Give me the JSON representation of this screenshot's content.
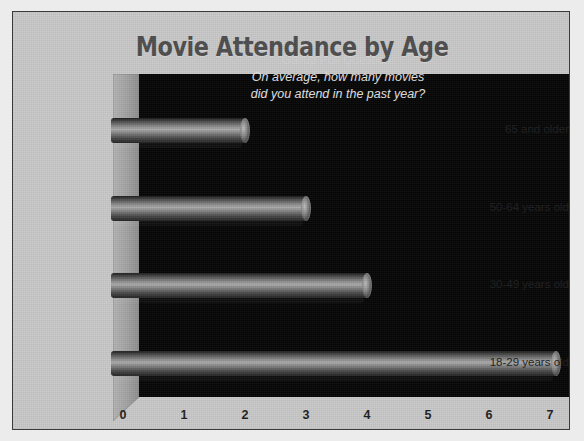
{
  "chart_data": {
    "type": "bar",
    "orientation": "horizontal",
    "title": "Movie Attendance by Age",
    "categories": [
      "65 and older",
      "50-64 years old",
      "30-49 years old",
      "18-29 years old"
    ],
    "values": [
      2.2,
      3.2,
      4.2,
      7.3
    ],
    "series": [
      {
        "name": "Average movies attended in past year",
        "values": [
          2.2,
          3.2,
          4.2,
          7.3
        ]
      }
    ],
    "xlabel": "",
    "ylabel": "",
    "xlim": [
      0,
      7.4
    ],
    "xticks": [
      0,
      1,
      2,
      3,
      4,
      5,
      6,
      7
    ],
    "xtick_labels": [
      "0",
      "1",
      "2",
      "3",
      "4",
      "5",
      "6",
      "7"
    ],
    "grid": false,
    "legend": false,
    "legend_position": "none",
    "annotations": [
      "Gallup Poll Question:",
      "On average, how many movies",
      "did you attend in the past year?"
    ],
    "style": {
      "plot_background": "#050505",
      "chart_background": "#c9c9c9",
      "title_color": "#4d4d4d",
      "tick_label_color": "#1d1d1d",
      "annotation_color": "#d7d7d7",
      "bar_color": "#8d8d8d",
      "three_d": true
    }
  },
  "annotation": {
    "heading": "Gallup Poll Question:",
    "line1": "On average, how many movies",
    "line2": "did you attend in the past year?"
  }
}
